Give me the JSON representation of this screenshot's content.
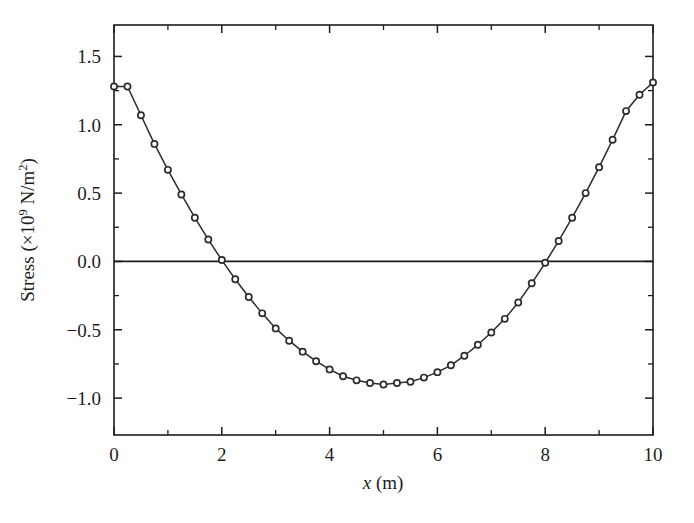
{
  "chart_data": {
    "type": "line",
    "title": "",
    "subtitle": "",
    "xlabel": "x (m)",
    "xlabel_italic_part": "x",
    "xlabel_rest": " (m)",
    "ylabel": "Stress (×10⁹ N/m²)",
    "ylabel_prefix": "Stress (×10",
    "ylabel_exponent": "9",
    "ylabel_mid": " N/m",
    "ylabel_exponent2": "2",
    "ylabel_suffix": ")",
    "xlim": [
      0,
      10
    ],
    "ylim": [
      -1.27,
      1.73
    ],
    "grid": false,
    "legend": null,
    "legend_position": "none",
    "x_ticks_major": [
      0,
      2,
      4,
      6,
      8,
      10
    ],
    "x_tick_labels": [
      "0",
      "2",
      "4",
      "6",
      "8",
      "10"
    ],
    "x_ticks_minor": [
      1,
      3,
      5,
      7,
      9
    ],
    "y_ticks_major": [
      -1.0,
      -0.5,
      0.0,
      0.5,
      1.0,
      1.5
    ],
    "y_tick_labels": [
      "−1.0",
      "−0.5",
      "0.0",
      "0.5",
      "1.0",
      "1.5"
    ],
    "y_ticks_minor": [
      -0.75,
      -0.25,
      0.25,
      0.75,
      1.25
    ],
    "marker": "open-circle",
    "line_color": "#2b2b2b",
    "marker_face_color": "#ffffff",
    "marker_edge_color": "#2b2b2b",
    "series": [
      {
        "name": "stress",
        "x": [
          0,
          0.25,
          0.5,
          0.75,
          1.0,
          1.25,
          1.5,
          1.75,
          2.0,
          2.25,
          2.5,
          2.75,
          3.0,
          3.25,
          3.5,
          3.75,
          4.0,
          4.25,
          4.5,
          4.75,
          5.0,
          5.25,
          5.5,
          5.75,
          6.0,
          6.25,
          6.5,
          6.75,
          7.0,
          7.25,
          7.5,
          7.75,
          8.0,
          8.25,
          8.5,
          8.75,
          9.0,
          9.25,
          9.5,
          9.75,
          10.0
        ],
        "y": [
          1.28,
          1.28,
          1.07,
          0.86,
          0.67,
          0.49,
          0.32,
          0.16,
          0.01,
          -0.13,
          -0.26,
          -0.38,
          -0.49,
          -0.58,
          -0.66,
          -0.73,
          -0.79,
          -0.84,
          -0.87,
          -0.89,
          -0.9,
          -0.89,
          -0.88,
          -0.85,
          -0.81,
          -0.76,
          -0.69,
          -0.61,
          -0.52,
          -0.42,
          -0.3,
          -0.16,
          -0.01,
          0.15,
          0.32,
          0.5,
          0.69,
          0.89,
          1.1,
          1.22,
          1.31
        ]
      }
    ],
    "zero_line": 0.0
  },
  "figure": {
    "background_color": "#ffffff",
    "axis_color": "#1d1d1d"
  }
}
